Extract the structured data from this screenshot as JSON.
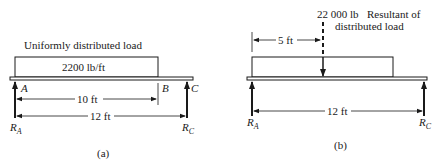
{
  "figure_a": {
    "caption": "(a)",
    "title": "Uniformly distributed load",
    "load_intensity": "2200 lb/ft",
    "points": {
      "A": "A",
      "B": "B",
      "C": "C"
    },
    "dim_AB": "10 ft",
    "dim_AC": "12 ft",
    "reactions": {
      "RA_main": "R",
      "RA_sub": "A",
      "RC_main": "R",
      "RC_sub": "C"
    }
  },
  "figure_b": {
    "caption": "(b)",
    "resultant_value": "22 000 lb",
    "resultant_desc_line1": "Resultant of",
    "resultant_desc_line2": "distributed load",
    "dim_resultant": "5 ft",
    "dim_AC": "12 ft",
    "reactions": {
      "RA_main": "R",
      "RA_sub": "A",
      "RC_main": "R",
      "RC_sub": "C"
    }
  },
  "colors": {
    "ink": "#1a1a1a",
    "background": "#ffffff"
  }
}
